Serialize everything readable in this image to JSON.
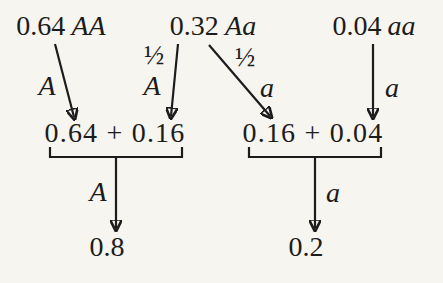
{
  "colors": {
    "background": "#f7f5f0",
    "ink": "#1c1c1c"
  },
  "genotype_frequencies": {
    "AA": {
      "value": "0.64",
      "genotype": "AA"
    },
    "Aa": {
      "value": "0.32",
      "genotype": "Aa"
    },
    "aa": {
      "value": "0.04",
      "genotype": "aa"
    }
  },
  "gamete_labels": {
    "fraction_Aa_A": "½",
    "fraction_Aa_a": "½",
    "from_AA": "A",
    "from_Aa_A": "A",
    "from_Aa_a": "a",
    "from_aa": "a"
  },
  "allele_totals": {
    "A": {
      "sum": "0.64 + 0.16",
      "allele": "A",
      "total": "0.8"
    },
    "a": {
      "sum": "0.16 + 0.04",
      "allele": "a",
      "total": "0.2"
    }
  }
}
